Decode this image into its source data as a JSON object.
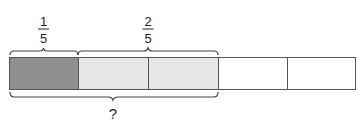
{
  "diagram": {
    "type": "tape-diagram",
    "total_parts": 5,
    "parts": [
      {
        "index": 0,
        "shade": "dark",
        "color": "#909090"
      },
      {
        "index": 1,
        "shade": "light",
        "color": "#e6e6e6"
      },
      {
        "index": 2,
        "shade": "light",
        "color": "#e6e6e6"
      },
      {
        "index": 3,
        "shade": "none",
        "color": "#ffffff"
      },
      {
        "index": 4,
        "shade": "none",
        "color": "#ffffff"
      }
    ],
    "top_labels": [
      {
        "numerator": "1",
        "denominator": "5",
        "spans_parts": [
          0
        ]
      },
      {
        "numerator": "2",
        "denominator": "5",
        "spans_parts": [
          1,
          2
        ]
      }
    ],
    "bottom_label": {
      "text": "?",
      "spans_parts": [
        0,
        1,
        2
      ]
    },
    "colors": {
      "outline": "#555555",
      "brace": "#444444",
      "dark_fill": "#909090",
      "light_fill": "#e6e6e6",
      "text": "#222222"
    }
  }
}
